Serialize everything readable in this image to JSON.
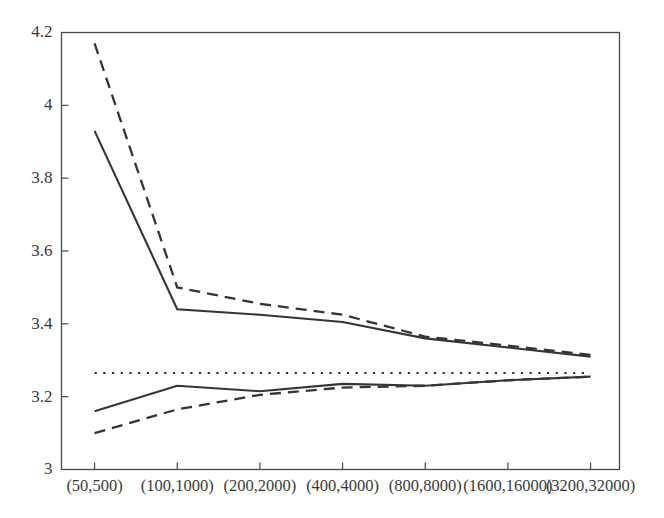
{
  "chart_data": {
    "type": "line",
    "title": "",
    "xlabel": "",
    "ylabel": "",
    "grid": false,
    "legend": "none",
    "categories": [
      "(50,500)",
      "(100,1000)",
      "(200,2000)",
      "(400,4000)",
      "(800,8000)",
      "(1600,16000)",
      "(3200,32000)"
    ],
    "x": [
      1,
      2,
      3,
      4,
      5,
      6,
      7
    ],
    "xlim": [
      0.6,
      7.35
    ],
    "ylim": [
      3,
      4.2
    ],
    "yticks": [
      3,
      3.2,
      3.4,
      3.6,
      3.8,
      4,
      4.2
    ],
    "ytick_labels": [
      "3",
      "3.2",
      "3.4",
      "3.6",
      "3.8",
      "4",
      "4.2"
    ],
    "series": [
      {
        "name": "upper-solid",
        "style": "solid",
        "color": "#353535",
        "values": [
          3.93,
          3.44,
          3.425,
          3.405,
          3.36,
          3.335,
          3.31
        ]
      },
      {
        "name": "upper-dashed",
        "style": "dashed",
        "color": "#353535",
        "values": [
          4.17,
          3.5,
          3.455,
          3.425,
          3.365,
          3.34,
          3.315
        ]
      },
      {
        "name": "lower-solid",
        "style": "solid",
        "color": "#353535",
        "values": [
          3.16,
          3.23,
          3.215,
          3.235,
          3.23,
          3.245,
          3.255
        ]
      },
      {
        "name": "lower-dashed",
        "style": "dashed",
        "color": "#353535",
        "values": [
          3.1,
          3.165,
          3.205,
          3.225,
          3.23,
          3.245,
          3.255
        ]
      },
      {
        "name": "reference-dotted",
        "style": "dotted",
        "color": "#2e2e2e",
        "values": [
          3.265,
          3.265,
          3.265,
          3.265,
          3.265,
          3.265,
          3.265
        ]
      }
    ]
  }
}
